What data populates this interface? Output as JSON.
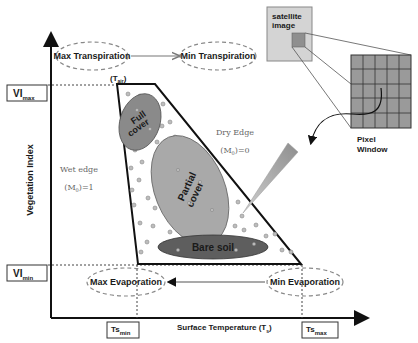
{
  "diagram": {
    "axes": {
      "x_label": "Surface Temperature (T",
      "x_label_sub": "s",
      "x_label_close": ")",
      "y_label": "Vegetation Index",
      "ts_min": "Ts",
      "ts_min_sub": "min",
      "ts_max": "Ts",
      "ts_max_sub": "max",
      "vi_max": "VI",
      "vi_max_sub": "max",
      "vi_min": "VI",
      "vi_min_sub": "min"
    },
    "top_flow": {
      "left": "Max Transpiration",
      "right": "Min Transpiration"
    },
    "bottom_flow": {
      "left": "Max Evaporation",
      "right": "Min Evaporation"
    },
    "t_air": "(T",
    "t_air_sub": "air",
    "t_air_close": ")",
    "regions": {
      "full_cover": [
        "Full",
        "cover"
      ],
      "partial_cover": [
        "Partial",
        "cover"
      ],
      "bare_soil": "Bare soil"
    },
    "edges": {
      "wet_edge": "Wet edge",
      "wet_value": "(M",
      "wet_value_sub": "0",
      "wet_value_end": ")=1",
      "dry_edge": "Dry Edge",
      "dry_value": "(M",
      "dry_value_sub": "0",
      "dry_value_end": ")=0"
    },
    "satellite": {
      "line1": "satellite",
      "line2": "image"
    },
    "pixel_window": {
      "line1": "Pixel",
      "line2": "Window",
      "grid_cols": 5,
      "grid_rows": 5
    },
    "colors": {
      "axis": "#111111",
      "ellipse_full": "#8a8a8a",
      "ellipse_partial": "#a9a9a9",
      "ellipse_bare": "#5e5e5e",
      "grid_fill": "#9a9a9a",
      "dashed": "#777777"
    }
  }
}
